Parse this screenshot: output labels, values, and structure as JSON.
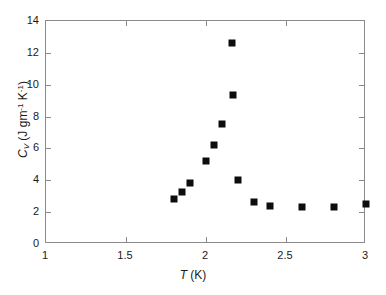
{
  "chart_data": {
    "type": "scatter",
    "title": "",
    "xlabel": "T (K)",
    "ylabel": "C_V (J gm^-1 K^-1)",
    "xlim": [
      1,
      3
    ],
    "ylim": [
      0,
      14
    ],
    "xticks": [
      1,
      1.5,
      2,
      2.5,
      3
    ],
    "xtick_labels": [
      "1",
      "1.5",
      "2",
      "2.5",
      "3"
    ],
    "yticks": [
      0,
      2,
      4,
      6,
      8,
      10,
      12,
      14
    ],
    "ytick_labels": [
      "0",
      "2",
      "4",
      "6",
      "8",
      "10",
      "12",
      "14"
    ],
    "grid": false,
    "legend": false,
    "marker_color": "#0d0d0d",
    "marker_shape": "square",
    "axis_color": "#8a8a8a",
    "series": [
      {
        "name": "Cv",
        "x": [
          1.8,
          1.85,
          1.9,
          2.0,
          2.05,
          2.1,
          2.16,
          2.17,
          2.2,
          2.3,
          2.4,
          2.6,
          2.8,
          3.0
        ],
        "y": [
          2.8,
          3.25,
          3.8,
          5.2,
          6.2,
          7.55,
          12.6,
          9.35,
          4.0,
          2.65,
          2.4,
          2.3,
          2.35,
          2.5
        ]
      }
    ]
  },
  "axis_labels": {
    "x_symbol": "T",
    "x_unit": "(K)",
    "y_symbol": "C",
    "y_subscript": "V",
    "y_unit_open": "(J gm",
    "y_exp1": "-1",
    "y_mid": " K",
    "y_exp2": "-1",
    "y_unit_close": ")"
  }
}
